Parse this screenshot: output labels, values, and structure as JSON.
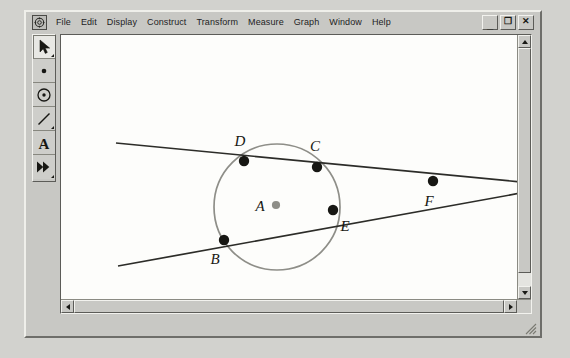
{
  "window": {
    "sys_menu_icon": "app-system-menu-icon",
    "buttons": [
      {
        "name": "minimize",
        "glyph": "_"
      },
      {
        "name": "restore",
        "glyph": "❐"
      },
      {
        "name": "close",
        "glyph": "✕"
      }
    ]
  },
  "menubar": {
    "items": [
      {
        "label": "File"
      },
      {
        "label": "Edit"
      },
      {
        "label": "Display"
      },
      {
        "label": "Construct"
      },
      {
        "label": "Transform"
      },
      {
        "label": "Measure"
      },
      {
        "label": "Graph"
      },
      {
        "label": "Window"
      },
      {
        "label": "Help"
      }
    ]
  },
  "toolbox": {
    "tools": [
      {
        "name": "selection-arrow-tool",
        "icon": "arrow-icon",
        "active": true,
        "has_submenu": true
      },
      {
        "name": "point-tool",
        "icon": "point-icon",
        "active": false,
        "has_submenu": false
      },
      {
        "name": "compass-circle-tool",
        "icon": "circle-icon",
        "active": false,
        "has_submenu": false
      },
      {
        "name": "straightedge-tool",
        "icon": "segment-icon",
        "active": false,
        "has_submenu": true
      },
      {
        "name": "text-tool",
        "icon": "letter-a-icon",
        "active": false,
        "has_submenu": false
      },
      {
        "name": "custom-tool",
        "icon": "double-arrow-icon",
        "active": false,
        "has_submenu": true
      }
    ]
  },
  "sketch": {
    "geometry": {
      "circle": {
        "cx": 215,
        "cy": 171,
        "r": 63,
        "color": "#8e8e88"
      },
      "center_point": {
        "label": "A",
        "x": 214,
        "y": 169,
        "color": "#8e8e88",
        "label_x": 198,
        "label_y": 175
      },
      "secant_line_1": {
        "from": [
          54,
          107
        ],
        "to": [
          459,
          146
        ],
        "points": [
          {
            "label": "D",
            "x": 182,
            "y": 125,
            "label_x": 178,
            "label_y": 110
          },
          {
            "label": "C",
            "x": 255,
            "y": 131,
            "label_x": 253,
            "label_y": 115
          }
        ]
      },
      "secant_line_2": {
        "from": [
          56,
          230
        ],
        "to": [
          459,
          157
        ],
        "points": [
          {
            "label": "B",
            "x": 162,
            "y": 204,
            "label_x": 153,
            "label_y": 228
          },
          {
            "label": "E",
            "x": 271,
            "y": 174,
            "label_x": 283,
            "label_y": 195
          }
        ]
      },
      "intersection_point": {
        "label": "F",
        "x": 371,
        "y": 145,
        "label_x": 367,
        "label_y": 170
      }
    }
  },
  "scrollbars": {
    "vertical": {
      "up_arrow": "scroll-up-arrow",
      "down_arrow": "scroll-down-arrow"
    },
    "horizontal": {
      "left_arrow": "scroll-left-arrow",
      "right_arrow": "scroll-right-arrow"
    }
  }
}
